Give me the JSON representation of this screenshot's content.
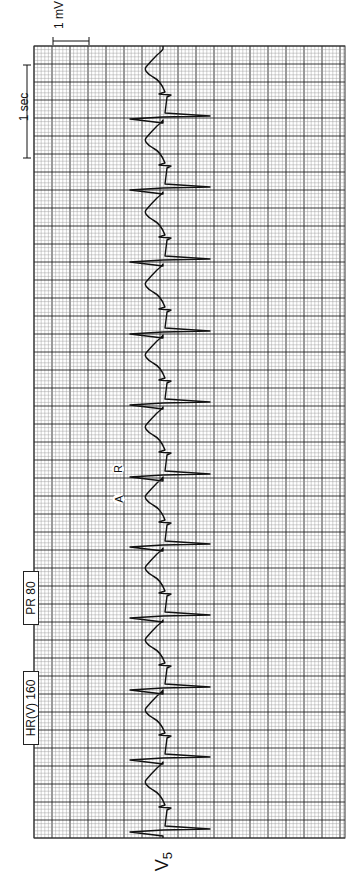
{
  "strip": {
    "lead": "V",
    "lead_sub": "5",
    "calibration": {
      "voltage_label": "1 mV",
      "time_label": "1 sec"
    },
    "labels": [
      {
        "id": "hr",
        "text": "HR(V)  160"
      },
      {
        "id": "pr",
        "text": "PR  80"
      }
    ],
    "markers": [
      {
        "id": "A",
        "text": "A"
      },
      {
        "id": "R",
        "text": "R"
      }
    ],
    "grid": {
      "x0": 34,
      "x1": 345,
      "y0": 46,
      "y1": 838,
      "small": 3.6,
      "large": 18,
      "minor_color": "#9a9a9a",
      "major_color": "#222222"
    },
    "trace": {
      "color": "#111111",
      "baseline_x": 163,
      "qrs_positions_y": [
        117,
        188,
        260,
        332,
        403,
        475,
        545,
        616,
        688,
        758,
        830
      ]
    }
  },
  "chart_data": {
    "type": "line",
    "lead": "V5",
    "heart_rate_ventricular_bpm": 160,
    "pr_interval_ms": 80,
    "calibration": {
      "amplitude": "1 mV",
      "time": "1 sec"
    },
    "annotations": [
      "A",
      "R",
      "HR(V) 160",
      "PR 80"
    ],
    "beats_visible": 11,
    "grid": true,
    "orientation": "rotated -90deg (time runs bottom to top)"
  }
}
